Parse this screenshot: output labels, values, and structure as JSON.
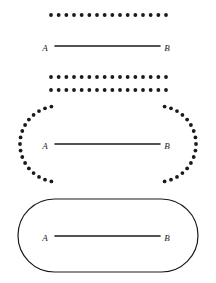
{
  "page": {
    "background_color": "#ffffff",
    "ink_color": "#1a1a1a",
    "width": 216,
    "height": 283
  },
  "figures": [
    {
      "id": "figure-strip",
      "name": "dotted-strip-neighborhood",
      "description": "Segment AB between two horizontal dotted lines",
      "segment": {
        "label_start": "A",
        "label_end": "B",
        "x1": 55,
        "x2": 160,
        "y": 46,
        "label_start_x": 45,
        "label_end_x": 167,
        "label_y": 49
      },
      "dotted_lines": [
        {
          "name": "upper-dotted-line",
          "y": 15,
          "x_start": 51,
          "x_end": 166,
          "dot_count": 16,
          "dot_radius": 1.9
        },
        {
          "name": "lower-dotted-line",
          "y": 77,
          "x_start": 51,
          "x_end": 166,
          "dot_count": 16,
          "dot_radius": 1.9
        }
      ]
    },
    {
      "id": "figure-dotted-stadium",
      "name": "dotted-stadium-neighborhood",
      "description": "Segment AB inside a dotted stadium outline with rounded dotted caps",
      "segment": {
        "label_start": "A",
        "label_end": "B",
        "x1": 55,
        "x2": 160,
        "y": 144,
        "label_start_x": 45,
        "label_end_x": 167,
        "label_y": 147
      },
      "dotted_top": {
        "name": "upper-dotted-line",
        "y": 90,
        "x_start": 51,
        "x_end": 166,
        "dot_count": 16,
        "dot_radius": 1.9
      },
      "dotted_caps": [
        {
          "name": "left-dotted-arc",
          "cx": 58,
          "cy": 144,
          "r": 38,
          "start_deg": 100,
          "end_deg": 260,
          "dot_count": 17,
          "dot_radius": 1.9
        },
        {
          "name": "right-dotted-arc",
          "cx": 158,
          "cy": 144,
          "r": 38,
          "start_deg": -80,
          "end_deg": 80,
          "dot_count": 17,
          "dot_radius": 1.9
        }
      ]
    },
    {
      "id": "figure-solid-stadium",
      "name": "solid-stadium-neighborhood",
      "description": "Segment AB inside a solid stadium (capsule) outline",
      "segment": {
        "label_start": "A",
        "label_end": "B",
        "x1": 55,
        "x2": 160,
        "y": 236,
        "label_start_x": 45,
        "label_end_x": 167,
        "label_y": 239
      },
      "stadium": {
        "name": "stadium-outline",
        "left": 18,
        "top": 199,
        "right": 198,
        "bottom": 272,
        "radius": 36.5,
        "stroke_width": 1.2
      }
    }
  ],
  "style": {
    "segment_stroke_width": 1.6,
    "dot_color": "#1a1a1a",
    "line_color": "#1a1a1a",
    "stadium_stroke_color": "#1a1a1a"
  }
}
